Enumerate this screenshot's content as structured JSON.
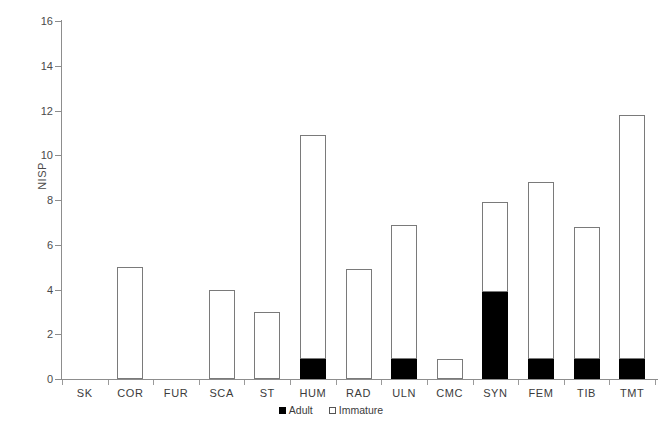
{
  "chart_data": {
    "type": "bar",
    "stacked": true,
    "title": "",
    "xlabel": "",
    "ylabel": "NISP",
    "ylim": [
      0,
      16
    ],
    "yticks": [
      0,
      2,
      4,
      6,
      8,
      10,
      12,
      14,
      16
    ],
    "grid": false,
    "legend_position": "bottom-center",
    "categories": [
      "SK",
      "COR",
      "FUR",
      "SCA",
      "ST",
      "HUM",
      "RAD",
      "ULN",
      "CMC",
      "SYN",
      "FEM",
      "TIB",
      "TMT"
    ],
    "series": [
      {
        "name": "Adult",
        "color": "#000000",
        "values": [
          0,
          0,
          0,
          0,
          0,
          0.9,
          0,
          0.9,
          0,
          3.9,
          0.9,
          0.9,
          0.9
        ]
      },
      {
        "name": "Immature",
        "color": "#ffffff",
        "values": [
          0,
          5,
          0,
          4,
          3,
          10,
          4.9,
          6,
          0.9,
          4,
          7.9,
          5.9,
          10.9
        ]
      }
    ],
    "totals": [
      0,
      5,
      0,
      4,
      3,
      10.9,
      4.9,
      6.9,
      0.9,
      7.9,
      8.8,
      6.8,
      11.8
    ]
  },
  "legend": {
    "items": [
      {
        "label": "Adult",
        "icon": "filled-square-icon"
      },
      {
        "label": "Immature",
        "icon": "open-square-icon"
      }
    ]
  }
}
